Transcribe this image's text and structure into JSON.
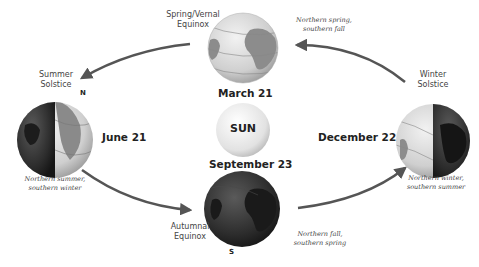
{
  "sun": {
    "label": "SUN"
  },
  "positions": [
    {
      "id": "spring",
      "title_line1": "Spring/Vernal",
      "title_line2": "Equinox",
      "date": "March 21",
      "note_line1": "Northern spring,",
      "note_line2": "southern fall"
    },
    {
      "id": "summer",
      "title_line1": "Summer",
      "title_line2": "Solstice",
      "date": "June 21",
      "note_line1": "Northern summer,",
      "note_line2": "southern winter",
      "pole": "N"
    },
    {
      "id": "autumn",
      "title_line1": "Autumnal",
      "title_line2": "Equinox",
      "date": "September 23",
      "note_line1": "Northern fall,",
      "note_line2": "southern spring",
      "pole": "S"
    },
    {
      "id": "winter",
      "title_line1": "Winter",
      "title_line2": "Solstice",
      "date": "December 22",
      "note_line1": "Northern winter,",
      "note_line2": "southern summer"
    }
  ],
  "colors": {
    "arrow": "#555555",
    "globe_light": "#d8d8d8",
    "globe_dark": "#2a2a2a",
    "sun": "#e6e6e6"
  }
}
